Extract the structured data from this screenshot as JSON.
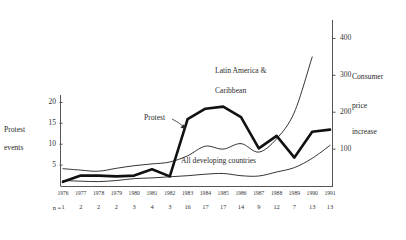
{
  "chart_data": {
    "type": "line",
    "title": "",
    "xlabel": "",
    "ylabel_left_line1": "Protest",
    "ylabel_left_line2": "events",
    "ylabel_right_line1": "Consumer",
    "ylabel_right_line2": "price",
    "ylabel_right_line3": "increase",
    "x": [
      "1976",
      "1977",
      "1978",
      "1979",
      "1980",
      "1981",
      "1982",
      "1983",
      "1984",
      "1985",
      "1986",
      "1987",
      "1988",
      "1989",
      "1990",
      "1991"
    ],
    "n_label": "n  =",
    "n_values": [
      1,
      2,
      2,
      2,
      3,
      4,
      3,
      16,
      17,
      17,
      14,
      9,
      12,
      7,
      13,
      13
    ],
    "left_axis": {
      "ticks": [
        5,
        10,
        15,
        20
      ],
      "min": 0,
      "max": 22.5,
      "label": "Protest events"
    },
    "right_axis": {
      "ticks": [
        100,
        200,
        300,
        400
      ],
      "min": 0,
      "max": 450,
      "label": "Consumer price increase"
    },
    "grid": false,
    "legend": "inline-annotations",
    "series": [
      {
        "name": "Protest",
        "axis": "left",
        "style": "thick-black",
        "annotation": "Protest",
        "values": [
          1,
          2.5,
          2.5,
          2.3,
          2.5,
          4,
          2.3,
          16,
          18.5,
          19,
          16.5,
          9,
          12,
          6.8,
          13,
          13.5
        ]
      },
      {
        "name": "All developing countries",
        "axis": "right",
        "style": "thin-black",
        "annotation": "All developing countries",
        "values": [
          15,
          13,
          12,
          15,
          20,
          22,
          25,
          28,
          32,
          34,
          28,
          27,
          38,
          50,
          75,
          110
        ]
      },
      {
        "name": "Latin America & Caribbean",
        "axis": "right",
        "style": "thin-black",
        "annotation": "Latin America & Caribbean",
        "values": [
          47,
          43,
          40,
          48,
          55,
          60,
          65,
          82,
          108,
          100,
          115,
          92,
          128,
          200,
          350,
          null
        ]
      }
    ]
  }
}
